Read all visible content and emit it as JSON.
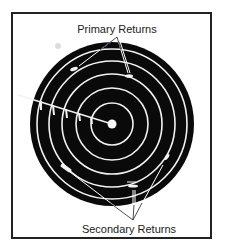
{
  "figure": {
    "labels": {
      "primary": "Primary Returns",
      "secondary": "Secondary Returns"
    },
    "colors": {
      "disc": "#0a0a0a",
      "rings": "#f2f2f2",
      "frame": "#222222",
      "text": "#222222"
    },
    "display": {
      "center": [
        112,
        124
      ],
      "outer_radius": 82,
      "ring_radii": [
        21,
        36,
        50,
        63,
        75
      ]
    }
  }
}
